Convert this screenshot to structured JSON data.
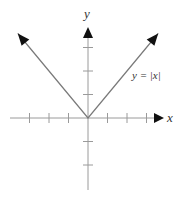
{
  "chart_data": {
    "type": "line",
    "title": "",
    "function_label": "y = |x|",
    "xlabel": "x",
    "ylabel": "y",
    "xlim": [
      -4,
      4
    ],
    "ylim": [
      -3,
      4
    ],
    "grid": false,
    "legend": "none",
    "x_ticks": [
      -3,
      -2,
      -1,
      1,
      2,
      3
    ],
    "y_ticks": [
      -2,
      -1,
      1,
      2,
      3
    ],
    "tick_labels_shown": false,
    "series": [
      {
        "name": "y = |x|",
        "x": [
          -3.6,
          -3,
          -2,
          -1,
          0,
          1,
          2,
          3,
          3.6
        ],
        "y": [
          3.6,
          3,
          2,
          1,
          0,
          1,
          2,
          3,
          3.6
        ],
        "arrows_at_ends": true
      }
    ],
    "axis_arrows": {
      "x_positive": true,
      "y_positive": true
    }
  },
  "colors": {
    "axis": "#9a9a9a",
    "curve": "#7a7a7a",
    "arrowhead": "#111111",
    "text": "#333333"
  },
  "layout": {
    "origin_px": [
      88,
      118
    ],
    "unit_x_px": 19.5,
    "unit_y_px": 23.5
  }
}
